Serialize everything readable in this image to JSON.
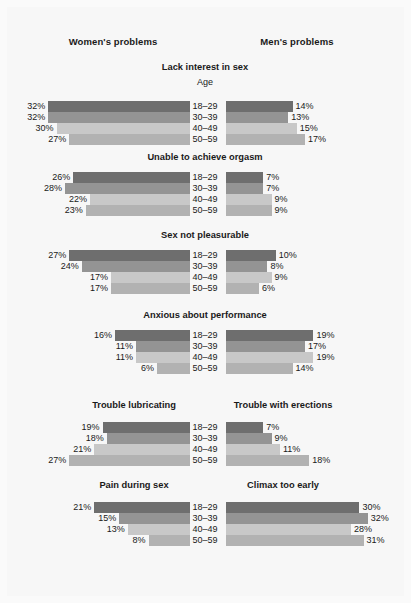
{
  "header": {
    "women_label": "Women's problems",
    "men_label": "Men's problems"
  },
  "age_caption": "Age",
  "chart_data": {
    "type": "bar",
    "orientation": "horizontal",
    "layout": "bidirectional paired bars, women left (right-anchored), men right (left-anchored)",
    "xlabel": "",
    "ylabel": "Age",
    "categories": [
      "18–29",
      "30–39",
      "40–49",
      "50–59"
    ],
    "value_unit": "%",
    "xlim": [
      0,
      35
    ],
    "grid": false,
    "legend": "none",
    "bar_colors": [
      "#6e6e6e",
      "#949494",
      "#c8c8c8",
      "#b2b2b2"
    ],
    "panels": [
      {
        "title": "Lack interest in sex",
        "women_title": "Lack interest in sex",
        "men_title": "Lack interest in sex",
        "shows_age_caption": true,
        "dual_title": false,
        "women": [
          32,
          32,
          30,
          27
        ],
        "men": [
          14,
          13,
          15,
          17
        ],
        "women_labels": [
          "32%",
          "32%",
          "30%",
          "27%"
        ],
        "men_labels": [
          "14%",
          "13%",
          "15%",
          "17%"
        ]
      },
      {
        "title": "Unable to achieve orgasm",
        "women_title": "Unable to achieve orgasm",
        "men_title": "Unable to achieve orgasm",
        "shows_age_caption": false,
        "dual_title": false,
        "women": [
          26,
          28,
          22,
          23
        ],
        "men": [
          7,
          7,
          9,
          9
        ],
        "women_labels": [
          "26%",
          "28%",
          "22%",
          "23%"
        ],
        "men_labels": [
          "7%",
          "7%",
          "9%",
          "9%"
        ]
      },
      {
        "title": "Sex not pleasurable",
        "women_title": "Sex not pleasurable",
        "men_title": "Sex not pleasurable",
        "shows_age_caption": false,
        "dual_title": false,
        "women": [
          27,
          24,
          17,
          17
        ],
        "men": [
          10,
          8,
          9,
          6
        ],
        "women_labels": [
          "27%",
          "24%",
          "17%",
          "17%"
        ],
        "men_labels": [
          "10%",
          "8%",
          "9%",
          "6%"
        ]
      },
      {
        "title": "Anxious about performance",
        "women_title": "Anxious about performance",
        "men_title": "Anxious about performance",
        "shows_age_caption": false,
        "dual_title": false,
        "women": [
          16,
          11,
          11,
          6
        ],
        "men": [
          19,
          17,
          19,
          14
        ],
        "women_labels": [
          "16%",
          "11%",
          "11%",
          "6%"
        ],
        "men_labels": [
          "19%",
          "17%",
          "19%",
          "14%"
        ]
      },
      {
        "title": "Trouble lubricating / Trouble with erections",
        "women_title": "Trouble lubricating",
        "men_title": "Trouble with erections",
        "shows_age_caption": false,
        "dual_title": true,
        "women": [
          19,
          18,
          21,
          27
        ],
        "men": [
          7,
          9,
          11,
          18
        ],
        "women_labels": [
          "19%",
          "18%",
          "21%",
          "27%"
        ],
        "men_labels": [
          "7%",
          "9%",
          "11%",
          "18%"
        ]
      },
      {
        "title": "Pain during sex / Climax too early",
        "women_title": "Pain during sex",
        "men_title": "Climax too early",
        "shows_age_caption": false,
        "dual_title": true,
        "women": [
          21,
          15,
          13,
          8
        ],
        "men": [
          30,
          32,
          28,
          31
        ],
        "women_labels": [
          "21%",
          "15%",
          "13%",
          "8%"
        ],
        "men_labels": [
          "30%",
          "32%",
          "28%",
          "31%"
        ]
      }
    ]
  }
}
